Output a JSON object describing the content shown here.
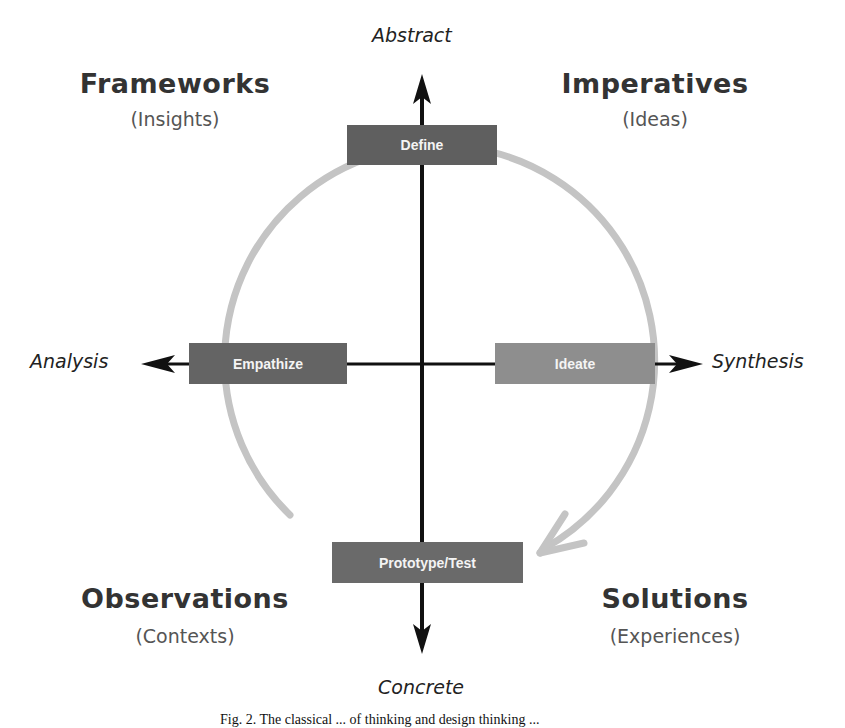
{
  "axes": {
    "top": "Abstract",
    "bottom": "Concrete",
    "left": "Analysis",
    "right": "Synthesis"
  },
  "quadrants": {
    "top_left": {
      "title": "Frameworks",
      "subtitle": "(Insights)"
    },
    "top_right": {
      "title": "Imperatives",
      "subtitle": "(Ideas)"
    },
    "bottom_left": {
      "title": "Observations",
      "subtitle": "(Contexts)"
    },
    "bottom_right": {
      "title": "Solutions",
      "subtitle": "(Experiences)"
    }
  },
  "stages": [
    {
      "label": "Define",
      "color": "#5f5f5f"
    },
    {
      "label": "Empathize",
      "color": "#646464"
    },
    {
      "label": "Ideate",
      "color": "#8e8e8e"
    },
    {
      "label": "Prototype/Test",
      "color": "#6a6a6a"
    }
  ],
  "colors": {
    "axis": "#111111",
    "cycle_arc": "#c4c4c4",
    "text_dark": "#333333"
  },
  "caption": "Fig. 2. The classical ... of thinking and design thinking ..."
}
